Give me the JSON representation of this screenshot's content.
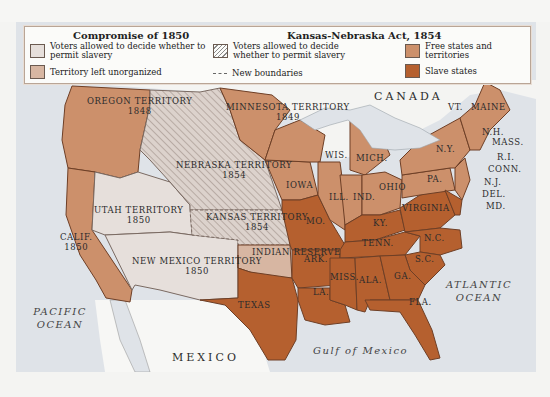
{
  "legend": {
    "compromise_title": "Compromise of 1850",
    "compromise_items": [
      {
        "label": "Voters allowed to decide whether to permit slavery",
        "swatch": "#e6dfdb"
      },
      {
        "label": "Territory left unorganized",
        "swatch": "#d7b6a2"
      }
    ],
    "kansas_title": "Kansas-Nebraska Act, 1854",
    "kansas_items": [
      {
        "label": "Voters allowed to decide whether to permit slavery",
        "swatch": "hatched"
      },
      {
        "label": "New boundaries",
        "swatch": "dashed-line"
      }
    ],
    "status_items": [
      {
        "label": "Free states and territories",
        "swatch": "#cc906b"
      },
      {
        "label": "Slave states",
        "swatch": "#b5602f"
      }
    ]
  },
  "colors": {
    "free": "#cc906b",
    "slave": "#b5602f",
    "popular_sovereignty_1850": "#e6dfdb",
    "unorganized": "#d7b6a2",
    "water": "#dfe3e8",
    "foreign_land": "#f7f7f5"
  },
  "regions": {
    "oregon": {
      "name": "OREGON TERRITORY",
      "year": "1848"
    },
    "minnesota": {
      "name": "MINNESOTA TERRITORY",
      "year": "1849"
    },
    "nebraska": {
      "name": "NEBRASKA TERRITORY",
      "year": "1854"
    },
    "utah": {
      "name": "UTAH TERRITORY",
      "year": "1850"
    },
    "kansas": {
      "name": "KANSAS TERRITORY",
      "year": "1854"
    },
    "calif": {
      "name": "CALIF.",
      "year": "1850"
    },
    "new_mexico": {
      "name": "NEW MEXICO TERRITORY",
      "year": "1850"
    },
    "indian_reserve": {
      "name": "INDIAN RESERVE"
    },
    "texas": {
      "name": "TEXAS"
    }
  },
  "states": {
    "wis": "WIS.",
    "mich": "MICH.",
    "iowa": "IOWA",
    "ill": "ILL.",
    "ind": "IND.",
    "ohio": "OHIO",
    "ny": "N.Y.",
    "pa": "PA.",
    "vt": "VT.",
    "maine": "MAINE",
    "nh": "N.H.",
    "mass": "MASS.",
    "ri": "R.I.",
    "conn": "CONN.",
    "nj": "N.J.",
    "del": "DEL.",
    "md": "MD.",
    "mo": "MO.",
    "ky": "KY.",
    "virginia": "VIRGINIA",
    "tenn": "TENN.",
    "nc": "N.C.",
    "sc": "S.C.",
    "ark": "ARK.",
    "miss": "MISS.",
    "ala": "ALA.",
    "ga": "GA.",
    "la": "LA.",
    "fla": "FLA."
  },
  "geography": {
    "canada": "CANADA",
    "mexico": "MEXICO",
    "pacific": "PACIFIC OCEAN",
    "atlantic": "ATLANTIC OCEAN",
    "gulf": "Gulf of Mexico"
  }
}
